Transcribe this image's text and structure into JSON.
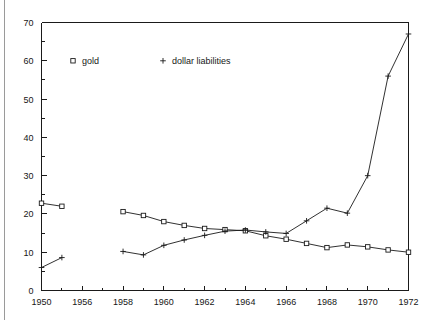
{
  "chart_data": {
    "type": "line",
    "title": "",
    "subtitle": "",
    "xlabel": "",
    "ylabel": "",
    "xlim": [
      1950,
      1972
    ],
    "ylim": [
      0,
      70
    ],
    "grid": false,
    "legend_position": "inside-top-left",
    "y_ticks": [
      0,
      10,
      20,
      30,
      40,
      50,
      60,
      70
    ],
    "y_tick_labels": [
      "0",
      "10",
      "20",
      "30",
      "40",
      "50",
      "60",
      "70"
    ],
    "x_ticks": [
      1950,
      1956,
      1958,
      1960,
      1962,
      1964,
      1966,
      1968,
      1970,
      1972
    ],
    "x_tick_labels": [
      "1950",
      "1956",
      "1958",
      "1960",
      "1962",
      "1964",
      "1966",
      "1968",
      "1970",
      "1972"
    ],
    "series": [
      {
        "name": "gold",
        "marker": "square",
        "segments": [
          {
            "x": [
              1950,
              1953
            ],
            "values": [
              22.8,
              22.0
            ]
          },
          {
            "x": [
              1958,
              1959,
              1960,
              1961,
              1962,
              1963,
              1964,
              1965,
              1966,
              1967,
              1968,
              1969,
              1970,
              1971,
              1972
            ],
            "values": [
              20.6,
              19.6,
              18.0,
              17.0,
              16.2,
              15.9,
              15.6,
              14.3,
              13.4,
              12.3,
              11.2,
              11.9,
              11.4,
              10.6,
              10.0
            ]
          }
        ]
      },
      {
        "name": "dollar liabilities",
        "marker": "plus",
        "segments": [
          {
            "x": [
              1950,
              1953
            ],
            "values": [
              6.0,
              8.6
            ]
          },
          {
            "x": [
              1958,
              1959,
              1960,
              1961,
              1962,
              1963,
              1964,
              1965,
              1966,
              1967,
              1968,
              1969,
              1970,
              1971,
              1972
            ],
            "values": [
              10.2,
              9.3,
              11.8,
              13.2,
              14.4,
              15.5,
              15.8,
              15.3,
              14.9,
              18.2,
              21.5,
              20.2,
              30.0,
              56.0,
              67.0
            ]
          }
        ]
      }
    ],
    "legend": [
      {
        "symbol": "square",
        "label": "gold"
      },
      {
        "symbol": "plus",
        "label": "dollar liabilities"
      }
    ]
  }
}
